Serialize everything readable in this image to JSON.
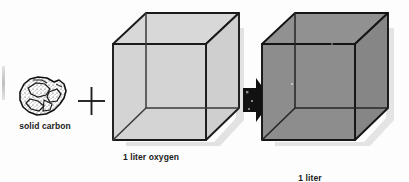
{
  "diagram": {
    "background_color": "#fdfdfd",
    "operator_plus": "+",
    "arrow": "right-arrow",
    "reactants": [
      {
        "id": "solid-carbon",
        "label": "solid carbon",
        "icon": "carbon-lump",
        "fill_color": "#ffffff",
        "stroke_color": "#111111"
      },
      {
        "id": "oxygen-cube",
        "label": "1 liter oxygen",
        "icon": "cube",
        "fill_color": "#d2d2d2",
        "stroke_color": "#1a1a1a"
      }
    ],
    "products": [
      {
        "id": "carbon-dioxide-cube",
        "label_line1": "1 liter",
        "label_line2": "carbon dioxide",
        "icon": "cube",
        "fill_color": "#8d8d8d",
        "stroke_color": "#141414"
      }
    ]
  }
}
